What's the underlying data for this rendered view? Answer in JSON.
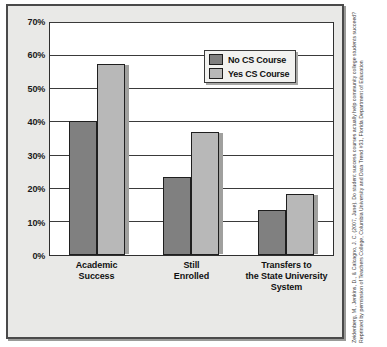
{
  "chart_data": {
    "type": "bar",
    "title": "",
    "subtitle": "",
    "xlabel": "",
    "ylabel": "",
    "categories": [
      "Academic Success",
      "Still Enrolled",
      "Transfers to the State University System"
    ],
    "category_lines": [
      [
        "Academic",
        "Success"
      ],
      [
        "Still",
        "Enrolled"
      ],
      [
        "Transfers to",
        "the State University",
        "System"
      ]
    ],
    "series": [
      {
        "name": "No CS Course",
        "values": [
          40.5,
          23.5,
          13.5
        ],
        "color": "#808080"
      },
      {
        "name": "Yes CS Course",
        "values": [
          57.5,
          37.0,
          18.5
        ],
        "color": "#b8b8b8"
      }
    ],
    "ylim": [
      0,
      70
    ],
    "yticks": [
      0,
      10,
      20,
      30,
      40,
      50,
      60,
      70
    ],
    "ytick_labels": [
      "0%",
      "10%",
      "20%",
      "30%",
      "40%",
      "50%",
      "60%",
      "70%"
    ],
    "grid": true,
    "grid_axis": "y",
    "legend_position": "top-right"
  },
  "legend": {
    "items": [
      {
        "label": "No CS Course",
        "swatch": "dark-gray-swatch"
      },
      {
        "label": "Yes CS Course",
        "swatch": "light-gray-swatch"
      }
    ]
  },
  "citation": {
    "text": "Zeidenberg, M., Jenkins, D., & Calcagno, J. C. (2007, June). Do student success courses actually help community college students succeed? Reprinted by permission of Teachers College, Columbia University and Data Trend #31, Florida Department of Education"
  }
}
